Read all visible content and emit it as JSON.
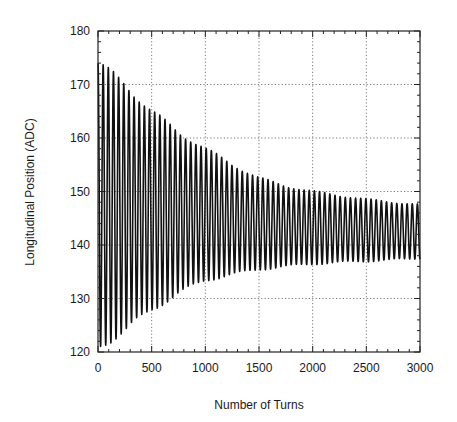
{
  "chart_data": {
    "type": "line",
    "title": "",
    "xlabel": "Number of Turns",
    "ylabel": "Longitudinal Position (ADC)",
    "xlim": [
      0,
      3000
    ],
    "ylim": [
      120,
      180
    ],
    "xticks": [
      0,
      500,
      1000,
      1500,
      2000,
      2500,
      3000
    ],
    "yticks": [
      120,
      130,
      140,
      150,
      160,
      170,
      180
    ],
    "x_minor_step": 100,
    "y_minor_step": 2,
    "grid": true,
    "legend": null,
    "series": [
      {
        "name": "Longitudinal position oscillation",
        "description": "Damped synchrotron-like oscillation, period about 48 turns, envelope decaying toward ~142",
        "period_turns": 48,
        "envelope": {
          "x": [
            0,
            250,
            500,
            750,
            1000,
            1250,
            1500,
            1750,
            2000,
            2500,
            3000
          ],
          "upper": [
            174,
            170,
            165,
            161,
            158,
            155,
            152.5,
            151,
            150,
            148.5,
            147.5
          ],
          "lower": [
            121,
            124,
            128,
            131,
            133.5,
            134.5,
            135.5,
            136,
            136.5,
            137,
            137.5
          ]
        }
      }
    ]
  },
  "axes": {
    "x_title": "Number of Turns",
    "y_title": "Longitudinal Position (ADC)"
  }
}
